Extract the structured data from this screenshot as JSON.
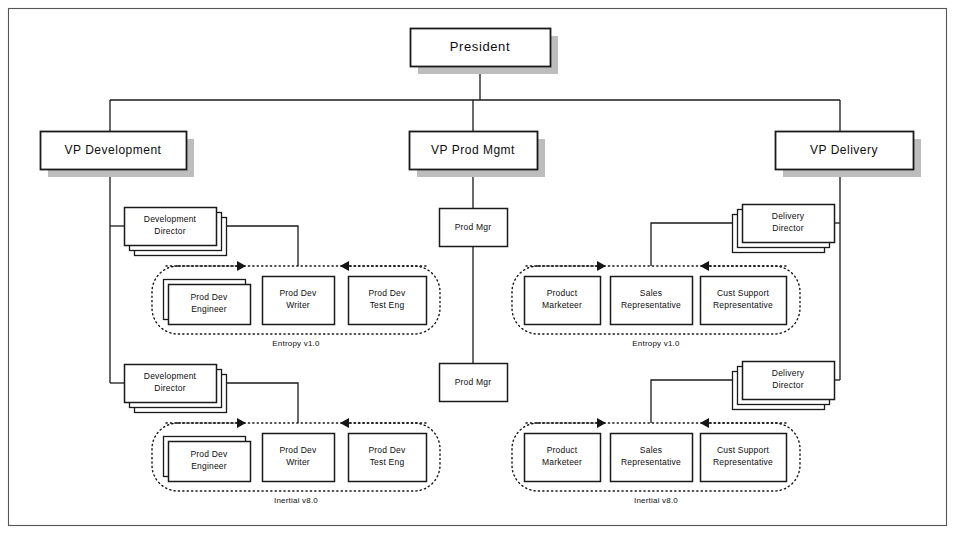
{
  "diagram": {
    "colors": {
      "box_fill": "#ffffff",
      "box_stroke": "#1a1a1a",
      "shadow": "#bdbdbd",
      "connector": "#1a1a1a",
      "group_border": "#151515",
      "frame": "#555555"
    },
    "frame": {
      "x": 8,
      "y": 8,
      "w": 938,
      "h": 517
    },
    "root": {
      "label": "President",
      "x": 410,
      "y": 28,
      "w": 140,
      "h": 38
    },
    "vps": [
      {
        "name": "vp-development",
        "label": "VP Development",
        "x": 40,
        "y": 131,
        "w": 146,
        "h": 38
      },
      {
        "name": "vp-prod-mgmt",
        "label": "VP Prod Mgmt",
        "x": 409,
        "y": 131,
        "w": 128,
        "h": 38
      },
      {
        "name": "vp-delivery",
        "label": "VP Delivery",
        "x": 775,
        "y": 131,
        "w": 138,
        "h": 38
      }
    ],
    "directors": [
      {
        "name": "development-director-1",
        "line1": "Development",
        "line2": "Director",
        "x": 124,
        "y": 207,
        "w": 92,
        "h": 38,
        "stack": 3,
        "stack_dir": "right"
      },
      {
        "name": "development-director-2",
        "line1": "Development",
        "line2": "Director",
        "x": 124,
        "y": 364,
        "w": 92,
        "h": 38,
        "stack": 3,
        "stack_dir": "right"
      },
      {
        "name": "delivery-director-1",
        "line1": "Delivery",
        "line2": "Director",
        "x": 742,
        "y": 204,
        "w": 92,
        "h": 38,
        "stack": 3,
        "stack_dir": "left"
      },
      {
        "name": "delivery-director-2",
        "line1": "Delivery",
        "line2": "Director",
        "x": 742,
        "y": 361,
        "w": 92,
        "h": 38,
        "stack": 3,
        "stack_dir": "left"
      }
    ],
    "prod_managers": [
      {
        "name": "prod-mgr-1",
        "label": "Prod Mgr",
        "x": 439,
        "y": 208,
        "w": 68,
        "h": 38
      },
      {
        "name": "prod-mgr-2",
        "label": "Prod Mgr",
        "x": 439,
        "y": 363,
        "w": 68,
        "h": 38
      }
    ],
    "groups": [
      {
        "name": "group-dev-entropy",
        "label": "Entropy v1.0",
        "x": 152,
        "y": 266,
        "w": 288,
        "h": 68,
        "label_x": 296,
        "label_y": 344,
        "arrows": [
          {
            "name": "group-arrow-left",
            "x1": 166,
            "y1": 266,
            "x2": 246,
            "y2": 266,
            "dir": "right"
          },
          {
            "name": "group-arrow-right",
            "x1": 426,
            "y1": 266,
            "x2": 340,
            "y2": 266,
            "dir": "left"
          }
        ],
        "members": [
          {
            "name": "prod-dev-engineer",
            "line1": "Prod Dev",
            "line2": "Engineer",
            "x": 168,
            "y": 284,
            "w": 82,
            "h": 40,
            "stack": 2,
            "stack_dir": "upright"
          },
          {
            "name": "prod-dev-writer",
            "line1": "Prod Dev",
            "line2": "Writer",
            "x": 262,
            "y": 276,
            "w": 72,
            "h": 48,
            "stack": 1,
            "stack_dir": "none"
          },
          {
            "name": "prod-dev-test-eng",
            "line1": "Prod Dev",
            "line2": "Test Eng",
            "x": 348,
            "y": 276,
            "w": 78,
            "h": 48,
            "stack": 1,
            "stack_dir": "none"
          }
        ]
      },
      {
        "name": "group-delivery-entropy",
        "label": "Entropy v1.0",
        "x": 512,
        "y": 266,
        "w": 288,
        "h": 68,
        "label_x": 656,
        "label_y": 344,
        "arrows": [
          {
            "name": "group-arrow-left",
            "x1": 526,
            "y1": 266,
            "x2": 606,
            "y2": 266,
            "dir": "right"
          },
          {
            "name": "group-arrow-right",
            "x1": 786,
            "y1": 266,
            "x2": 700,
            "y2": 266,
            "dir": "left"
          }
        ],
        "members": [
          {
            "name": "product-marketeer",
            "line1": "Product",
            "line2": "Marketeer",
            "x": 524,
            "y": 276,
            "w": 76,
            "h": 48,
            "stack": 1,
            "stack_dir": "none"
          },
          {
            "name": "sales-representative",
            "line1": "Sales",
            "line2": "Representative",
            "x": 610,
            "y": 276,
            "w": 82,
            "h": 48,
            "stack": 1,
            "stack_dir": "none"
          },
          {
            "name": "cust-support-representative",
            "line1": "Cust Support",
            "line2": "Representative",
            "x": 700,
            "y": 276,
            "w": 86,
            "h": 48,
            "stack": 1,
            "stack_dir": "none"
          }
        ]
      },
      {
        "name": "group-dev-inertial",
        "label": "Inertial v8.0",
        "x": 152,
        "y": 423,
        "w": 288,
        "h": 68,
        "label_x": 296,
        "label_y": 501,
        "arrows": [
          {
            "name": "group-arrow-left",
            "x1": 166,
            "y1": 423,
            "x2": 246,
            "y2": 423,
            "dir": "right"
          },
          {
            "name": "group-arrow-right",
            "x1": 426,
            "y1": 423,
            "x2": 340,
            "y2": 423,
            "dir": "left"
          }
        ],
        "members": [
          {
            "name": "prod-dev-engineer",
            "line1": "Prod Dev",
            "line2": "Engineer",
            "x": 168,
            "y": 441,
            "w": 82,
            "h": 40,
            "stack": 2,
            "stack_dir": "upright"
          },
          {
            "name": "prod-dev-writer",
            "line1": "Prod Dev",
            "line2": "Writer",
            "x": 262,
            "y": 433,
            "w": 72,
            "h": 48,
            "stack": 1,
            "stack_dir": "none"
          },
          {
            "name": "prod-dev-test-eng",
            "line1": "Prod Dev",
            "line2": "Test Eng",
            "x": 348,
            "y": 433,
            "w": 78,
            "h": 48,
            "stack": 1,
            "stack_dir": "none"
          }
        ]
      },
      {
        "name": "group-delivery-inertial",
        "label": "Inertial v8.0",
        "x": 512,
        "y": 423,
        "w": 288,
        "h": 68,
        "label_x": 656,
        "label_y": 501,
        "arrows": [
          {
            "name": "group-arrow-left",
            "x1": 526,
            "y1": 423,
            "x2": 606,
            "y2": 423,
            "dir": "right"
          },
          {
            "name": "group-arrow-right",
            "x1": 786,
            "y1": 423,
            "x2": 700,
            "y2": 423,
            "dir": "left"
          }
        ],
        "members": [
          {
            "name": "product-marketeer",
            "line1": "Product",
            "line2": "Marketeer",
            "x": 524,
            "y": 433,
            "w": 76,
            "h": 48,
            "stack": 1,
            "stack_dir": "none"
          },
          {
            "name": "sales-representative",
            "line1": "Sales",
            "line2": "Representative",
            "x": 610,
            "y": 433,
            "w": 82,
            "h": 48,
            "stack": 1,
            "stack_dir": "none"
          },
          {
            "name": "cust-support-representative",
            "line1": "Cust Support",
            "line2": "Representative",
            "x": 700,
            "y": 433,
            "w": 86,
            "h": 48,
            "stack": 1,
            "stack_dir": "none"
          }
        ]
      }
    ],
    "connectors": [
      {
        "name": "president-to-bus",
        "d": "M 480 66 L 480 100"
      },
      {
        "name": "top-bus",
        "d": "M 110 100 L 840 100"
      },
      {
        "name": "bus-to-vp-dev",
        "d": "M 110 100 L 110 131"
      },
      {
        "name": "bus-to-vp-prod",
        "d": "M 473 100 L 473 131"
      },
      {
        "name": "bus-to-vp-delivery",
        "d": "M 840 100 L 840 131"
      },
      {
        "name": "vp-dev-spine",
        "d": "M 110 169 L 110 383"
      },
      {
        "name": "vp-dev-to-dir1",
        "d": "M 110 226 L 124 226"
      },
      {
        "name": "vp-dev-to-dir2",
        "d": "M 110 383 L 124 383"
      },
      {
        "name": "dir1-to-writer",
        "d": "M 216 226 L 298 226 L 298 266"
      },
      {
        "name": "dir2-to-writer",
        "d": "M 216 383 L 298 383 L 298 423"
      },
      {
        "name": "vp-prod-to-mgr1",
        "d": "M 473 169 L 473 208"
      },
      {
        "name": "mgr1-to-mgr2",
        "d": "M 473 246 L 473 363"
      },
      {
        "name": "vp-del-spine",
        "d": "M 840 169 L 840 380"
      },
      {
        "name": "vp-del-to-dir1",
        "d": "M 840 223 L 834 223"
      },
      {
        "name": "vp-del-to-dir2",
        "d": "M 840 380 L 834 380"
      },
      {
        "name": "dir1-to-sales",
        "d": "M 742 223 L 651 223 L 651 266"
      },
      {
        "name": "dir2-to-sales",
        "d": "M 742 380 L 651 380 L 651 423"
      }
    ]
  }
}
